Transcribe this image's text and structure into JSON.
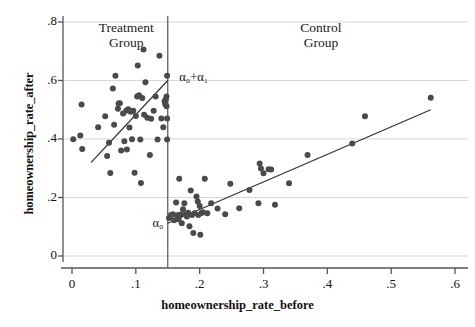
{
  "chart_data": {
    "type": "scatter",
    "title": "",
    "xlabel": "homeownership_rate_before",
    "ylabel": "homeownership_rate_after",
    "xlim": [
      -0.01,
      0.625
    ],
    "ylim": [
      -0.02,
      0.84
    ],
    "xticks": [
      "0",
      ".1",
      ".2",
      ".3",
      ".4",
      ".5",
      ".6"
    ],
    "xtick_values": [
      0,
      0.1,
      0.2,
      0.3,
      0.4,
      0.5,
      0.6
    ],
    "yticks": [
      "0",
      ".2",
      ".4",
      ".6",
      ".8"
    ],
    "ytick_values": [
      0,
      0.2,
      0.4,
      0.6,
      0.8
    ],
    "grid": "horizontal",
    "legend": "none",
    "marker_color": "#4a4a4a",
    "line_color": "#333333",
    "cutoff": 0.15,
    "annotations": [
      {
        "name": "treatment-group-label",
        "text": "Treatment\nGroup",
        "x": 0.085,
        "y": 0.785
      },
      {
        "name": "control-group-label",
        "text": "Control\nGroup",
        "x": 0.39,
        "y": 0.785
      },
      {
        "name": "alpha0-plus-alpha1-label",
        "text": "α₀+α₁",
        "x": 0.168,
        "y": 0.605
      },
      {
        "name": "alpha0-label",
        "text": "α₀",
        "x": 0.126,
        "y": 0.105
      }
    ],
    "fit_lines": [
      {
        "name": "treatment-fit-line",
        "x0": 0.03,
        "y0": 0.32,
        "x1": 0.15,
        "y1": 0.6
      },
      {
        "name": "control-fit-line",
        "x0": 0.15,
        "y0": 0.112,
        "x1": 0.562,
        "y1": 0.5
      }
    ],
    "series": [
      {
        "name": "Treatment Group",
        "points": [
          [
            0.002,
            0.399
          ],
          [
            0.013,
            0.412
          ],
          [
            0.015,
            0.518
          ],
          [
            0.016,
            0.366
          ],
          [
            0.041,
            0.44
          ],
          [
            0.052,
            0.478
          ],
          [
            0.055,
            0.342
          ],
          [
            0.058,
            0.387
          ],
          [
            0.06,
            0.284
          ],
          [
            0.064,
            0.573
          ],
          [
            0.066,
            0.449
          ],
          [
            0.068,
            0.616
          ],
          [
            0.072,
            0.503
          ],
          [
            0.073,
            0.521
          ],
          [
            0.075,
            0.522
          ],
          [
            0.077,
            0.361
          ],
          [
            0.08,
            0.487
          ],
          [
            0.082,
            0.392
          ],
          [
            0.085,
            0.497
          ],
          [
            0.086,
            0.364
          ],
          [
            0.088,
            0.502
          ],
          [
            0.09,
            0.439
          ],
          [
            0.092,
            0.493
          ],
          [
            0.094,
            0.399
          ],
          [
            0.096,
            0.497
          ],
          [
            0.098,
            0.285
          ],
          [
            0.1,
            0.479
          ],
          [
            0.102,
            0.545
          ],
          [
            0.103,
            0.651
          ],
          [
            0.105,
            0.55
          ],
          [
            0.107,
            0.398
          ],
          [
            0.108,
            0.25
          ],
          [
            0.11,
            0.54
          ],
          [
            0.112,
            0.706
          ],
          [
            0.113,
            0.483
          ],
          [
            0.115,
            0.594
          ],
          [
            0.118,
            0.473
          ],
          [
            0.122,
            0.345
          ],
          [
            0.124,
            0.469
          ],
          [
            0.128,
            0.497
          ],
          [
            0.131,
            0.545
          ],
          [
            0.134,
            0.398
          ],
          [
            0.137,
            0.685
          ],
          [
            0.14,
            0.47
          ],
          [
            0.143,
            0.44
          ],
          [
            0.145,
            0.53
          ],
          [
            0.146,
            0.52
          ],
          [
            0.147,
            0.535
          ],
          [
            0.148,
            0.512
          ],
          [
            0.148,
            0.545
          ],
          [
            0.149,
            0.616
          ],
          [
            0.149,
            0.398
          ],
          [
            0.149,
            0.47
          ]
        ]
      },
      {
        "name": "Control Group",
        "points": [
          [
            0.152,
            0.13
          ],
          [
            0.155,
            0.14
          ],
          [
            0.158,
            0.143
          ],
          [
            0.16,
            0.122
          ],
          [
            0.163,
            0.183
          ],
          [
            0.165,
            0.139
          ],
          [
            0.167,
            0.126
          ],
          [
            0.168,
            0.264
          ],
          [
            0.17,
            0.142
          ],
          [
            0.172,
            0.112
          ],
          [
            0.174,
            0.16
          ],
          [
            0.176,
            0.18
          ],
          [
            0.178,
            0.142
          ],
          [
            0.18,
            0.135
          ],
          [
            0.182,
            0.148
          ],
          [
            0.184,
            0.102
          ],
          [
            0.186,
            0.224
          ],
          [
            0.188,
            0.14
          ],
          [
            0.19,
            0.079
          ],
          [
            0.192,
            0.146
          ],
          [
            0.195,
            0.203
          ],
          [
            0.197,
            0.186
          ],
          [
            0.198,
            0.14
          ],
          [
            0.2,
            0.171
          ],
          [
            0.201,
            0.073
          ],
          [
            0.203,
            0.147
          ],
          [
            0.205,
            0.15
          ],
          [
            0.208,
            0.264
          ],
          [
            0.212,
            0.146
          ],
          [
            0.218,
            0.18
          ],
          [
            0.228,
            0.162
          ],
          [
            0.24,
            0.143
          ],
          [
            0.248,
            0.247
          ],
          [
            0.262,
            0.163
          ],
          [
            0.278,
            0.226
          ],
          [
            0.292,
            0.18
          ],
          [
            0.294,
            0.316
          ],
          [
            0.296,
            0.299
          ],
          [
            0.3,
            0.283
          ],
          [
            0.308,
            0.297
          ],
          [
            0.312,
            0.296
          ],
          [
            0.318,
            0.175
          ],
          [
            0.34,
            0.249
          ],
          [
            0.369,
            0.345
          ],
          [
            0.439,
            0.385
          ],
          [
            0.459,
            0.478
          ],
          [
            0.562,
            0.541
          ]
        ]
      }
    ]
  }
}
